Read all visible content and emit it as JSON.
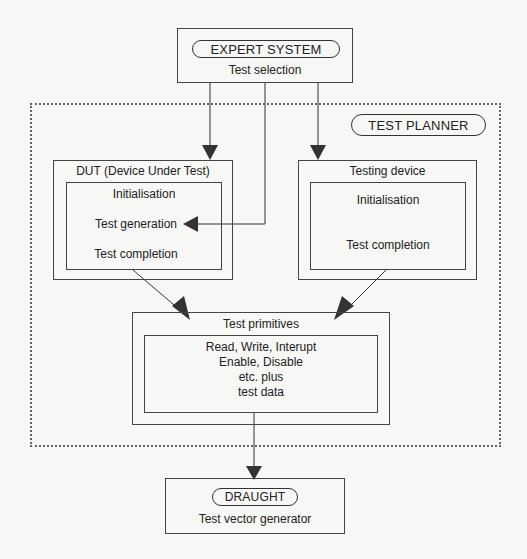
{
  "expert_system": {
    "title": "EXPERT SYSTEM",
    "subtitle": "Test selection"
  },
  "test_planner": {
    "title": "TEST PLANNER"
  },
  "dut": {
    "title": "DUT (Device Under Test)",
    "items": [
      "Initialisation",
      "Test generation",
      "Test completion"
    ]
  },
  "testing_device": {
    "title": "Testing device",
    "items": [
      "Initialisation",
      "Test completion"
    ]
  },
  "test_primitives": {
    "title": "Test primitives",
    "lines": [
      "Read, Write, Interupt",
      "Enable, Disable",
      "etc. plus",
      "test data"
    ]
  },
  "draught": {
    "title": "DRAUGHT",
    "subtitle": "Test vector generator"
  },
  "colors": {
    "line": "#333333",
    "background": "#f7f7f5",
    "dotted_border": "#666666"
  }
}
